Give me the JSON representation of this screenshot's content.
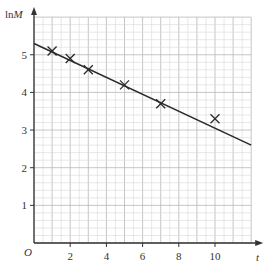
{
  "chart_data": {
    "type": "scatter",
    "title": "",
    "xlabel": "t",
    "ylabel": "lnM",
    "ylabel_parts": {
      "prefix": "ln",
      "var": "M"
    },
    "origin_label": "O",
    "xlim": [
      0,
      12
    ],
    "ylim": [
      0,
      6
    ],
    "x_ticks": [
      2,
      4,
      6,
      8,
      10
    ],
    "y_ticks": [
      1,
      2,
      3,
      4,
      5
    ],
    "x_tick_labels": [
      "2",
      "4",
      "6",
      "8",
      "10"
    ],
    "y_tick_labels": [
      "1",
      "2",
      "3",
      "4",
      "5"
    ],
    "grid": {
      "major": true,
      "minor": true,
      "x_minor_step": 0.5,
      "y_minor_step": 0.2
    },
    "series": [
      {
        "name": "data points",
        "marker": "x",
        "x": [
          1,
          2,
          3,
          5,
          7,
          10
        ],
        "y": [
          5.1,
          4.9,
          4.6,
          4.2,
          3.7,
          3.3
        ]
      },
      {
        "name": "line of best fit",
        "type": "line",
        "x": [
          0,
          12
        ],
        "y": [
          5.3,
          2.6
        ]
      }
    ],
    "legend": null
  },
  "colors": {
    "axis": "#333333",
    "grid_minor": "#d6d6d6",
    "grid_major": "#b8b8b8",
    "line": "#2a2a2a",
    "marker": "#2a2a2a"
  }
}
